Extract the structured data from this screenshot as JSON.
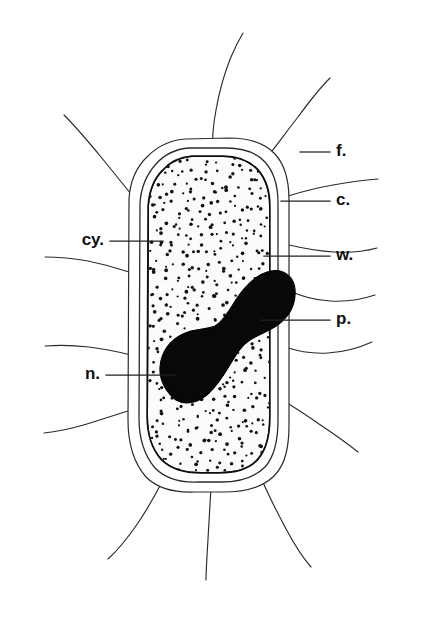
{
  "figure": {
    "kind": "biological-diagram",
    "background_color": "#ffffff",
    "ink_color": "#1a1a1a",
    "width": 423,
    "height": 631
  },
  "labels": [
    {
      "id": "flagella",
      "key": "f.",
      "side": "right",
      "text_x": 336,
      "text_y": 152,
      "leader_x1": 300,
      "leader_y1": 152,
      "leader_x2": 330,
      "leader_y2": 152
    },
    {
      "id": "capsule",
      "key": "c.",
      "side": "right",
      "text_x": 336,
      "text_y": 201,
      "leader_x1": 281,
      "leader_y1": 201,
      "leader_x2": 330,
      "leader_y2": 201
    },
    {
      "id": "cell-wall",
      "key": "w.",
      "side": "right",
      "text_x": 336,
      "text_y": 256,
      "leader_x1": 264,
      "leader_y1": 256,
      "leader_x2": 330,
      "leader_y2": 256
    },
    {
      "id": "plasma-membrane",
      "key": "p.",
      "side": "right",
      "text_x": 336,
      "text_y": 320,
      "leader_x1": 261,
      "leader_y1": 320,
      "leader_x2": 330,
      "leader_y2": 320
    },
    {
      "id": "cytoplasm",
      "key": "cy.",
      "side": "left",
      "text_x": 104,
      "text_y": 241,
      "leader_x1": 110,
      "leader_y1": 241,
      "leader_x2": 163,
      "leader_y2": 241
    },
    {
      "id": "nucleoid",
      "key": "n.",
      "side": "left",
      "text_x": 100,
      "text_y": 375,
      "leader_x1": 106,
      "leader_y1": 375,
      "leader_x2": 176,
      "leader_y2": 375
    }
  ],
  "structures": {
    "capsule": {
      "name": "capsule",
      "path": "M 186 139 C 170 140 158 146 148 156 C 136 167 130 182 129 199 L 128 420 C 128 443 133 462 146 477 C 158 489 175 493 196 492 L 223 492 C 244 492 262 488 274 476 C 286 464 289 446 289 424 L 289 200 C 289 180 285 164 274 153 C 263 142 248 138 229 138 Z"
    },
    "cell_wall": {
      "name": "cell wall",
      "path": "M 189 148 C 175 149 164 155 156 164 C 146 175 141 188 140 203 L 139 418 C 139 438 144 455 155 468 C 166 479 181 483 199 482 L 221 482 C 239 482 254 478 265 467 C 275 456 278 440 278 420 L 278 203 C 278 186 274 172 265 162 C 255 151 242 148 226 148 Z"
    },
    "plasma_membrane": {
      "name": "plasma membrane",
      "path": "M 192 157 C 180 158 170 163 163 171 C 154 180 150 192 149 206 L 148 416 C 148 434 152 448 162 459 C 172 469 185 472 201 472 L 219 472 C 235 472 248 469 257 459 C 266 449 269 435 269 417 L 269 206 C 269 191 265 179 257 170 C 248 161 237 157 223 157 Z"
    },
    "cytoplasm": {
      "name": "cytoplasm",
      "stipple": true,
      "fill": "#fbfbfb",
      "dot_color": "#111111"
    },
    "nucleoid": {
      "name": "nucleoid",
      "fill": "#080808",
      "path": "M 176 400 C 166 392 159 380 160 367 C 161 352 170 340 183 334 C 195 328 206 330 215 326 C 222 322 226 315 232 306 C 239 294 247 284 257 277 C 266 271 275 269 283 272 C 292 276 296 285 295 296 C 294 308 288 317 279 324 C 270 331 259 334 250 340 C 242 345 237 353 231 363 C 224 375 217 386 208 394 C 199 402 186 406 176 400 Z"
    }
  },
  "flagella": {
    "name": "flagella",
    "count": 12,
    "paths": [
      "M 213 152 C 212 140 213 126 216 110 C 219 93 224 74 231 57 C 236 45 240 38 243 33",
      "M 268 156 C 277 145 287 131 298 117 C 309 102 320 88 330 78",
      "M 288 196 C 301 192 316 188 333 185 C 350 182 366 180 378 179",
      "M 289 245 C 302 248 317 251 334 252 C 351 253 366 251 377 248",
      "M 288 290 C 300 296 314 300 330 301 C 347 302 363 299 375 295",
      "M 285 347 C 297 351 312 354 328 353 C 345 352 361 347 372 342",
      "M 281 399 C 292 406 305 414 319 424 C 334 434 348 444 358 452",
      "M 262 480 C 268 494 276 510 285 527 C 294 544 303 558 311 567",
      "M 211 487 C 210 503 209 521 208 539 C 207 557 206 571 206 580",
      "M 164 478 C 157 492 148 508 138 523 C 127 539 117 551 108 559",
      "M 131 410 C 118 414 103 419 87 424 C 70 429 55 432 44 433",
      "M 131 355 C 119 352 105 349 89 347 C 72 345 57 345 45 346",
      "M 129 272 C 117 268 103 264 88 261 C 71 258 56 257 45 257",
      "M 136 200 C 126 188 114 173 101 157 C 87 140 74 125 64 115"
    ]
  }
}
